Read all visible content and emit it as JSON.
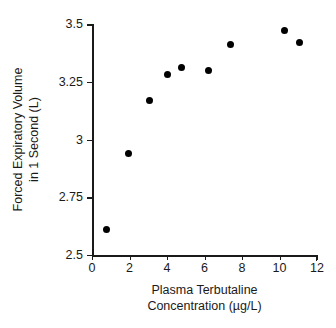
{
  "chart_data": {
    "type": "scatter",
    "title": "",
    "xlabel": "Plasma Terbutaline Concentration (µg/L)",
    "ylabel": "Forced Expiratory Volume in 1 Second (L)",
    "xlim": [
      0,
      12
    ],
    "ylim": [
      2.5,
      3.5
    ],
    "xticks": [
      "0",
      "2",
      "4",
      "6",
      "8",
      "10",
      "12"
    ],
    "xtick_values": [
      0,
      2,
      4,
      6,
      8,
      10,
      12
    ],
    "yticks": [
      "2.5",
      "2.75",
      "3",
      "3.25",
      "3.5"
    ],
    "ytick_values": [
      2.5,
      2.75,
      3,
      3.25,
      3.5
    ],
    "grid": false,
    "legend": null,
    "marker": "filled-circle",
    "marker_color": "#000000",
    "points": [
      {
        "x": 0.75,
        "y": 2.61
      },
      {
        "x": 1.92,
        "y": 2.94
      },
      {
        "x": 3.04,
        "y": 3.17
      },
      {
        "x": 4.0,
        "y": 3.28
      },
      {
        "x": 4.75,
        "y": 3.31
      },
      {
        "x": 6.19,
        "y": 3.3
      },
      {
        "x": 7.41,
        "y": 3.41
      },
      {
        "x": 10.24,
        "y": 3.47
      },
      {
        "x": 11.04,
        "y": 3.42
      }
    ]
  },
  "axis_titles": {
    "y_line1": "Forced Expiratory Volume",
    "y_line2": "in 1 Second (L)",
    "x_line1": "Plasma Terbutaline",
    "x_line2": "Concentration (µg/L)"
  }
}
